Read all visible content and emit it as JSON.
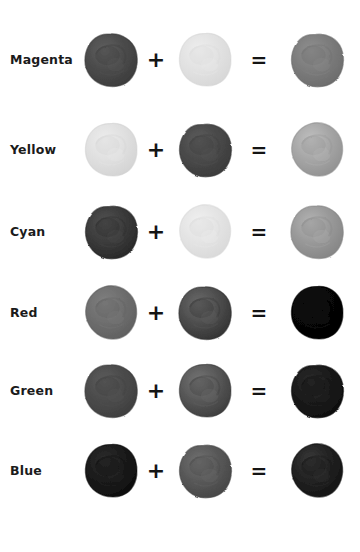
{
  "figure": {
    "background_color": "#ffffff",
    "operator_plus": "+",
    "operator_equals": "=",
    "text_color": "#1b1b1b"
  },
  "rows": [
    {
      "label": "Magenta",
      "left_swatch": {
        "name": "magenta-paint-blob",
        "gray_hex": "#4b4b4b",
        "shade_hex": "#3a3a3a",
        "highlight_hex": "#606060"
      },
      "right_swatch": {
        "name": "yellow-paint-blob",
        "gray_hex": "#e2e2e2",
        "shade_hex": "#d6d6d6",
        "highlight_hex": "#eeeeee"
      },
      "result_swatch": {
        "name": "red-result-blob",
        "gray_hex": "#7c7c7c",
        "shade_hex": "#6a6a6a",
        "highlight_hex": "#909090"
      }
    },
    {
      "label": "Yellow",
      "left_swatch": {
        "name": "yellow-paint-blob",
        "gray_hex": "#e0e0e0",
        "shade_hex": "#d2d2d2",
        "highlight_hex": "#ededed"
      },
      "right_swatch": {
        "name": "cyan-paint-blob",
        "gray_hex": "#494949",
        "shade_hex": "#393939",
        "highlight_hex": "#5d5d5d"
      },
      "result_swatch": {
        "name": "green-result-blob",
        "gray_hex": "#a6a6a6",
        "shade_hex": "#8f8f8f",
        "highlight_hex": "#c0c0c0"
      }
    },
    {
      "label": "Cyan",
      "left_swatch": {
        "name": "cyan-paint-blob",
        "gray_hex": "#3b3b3b",
        "shade_hex": "#262626",
        "highlight_hex": "#525252"
      },
      "right_swatch": {
        "name": "yellow-paint-blob",
        "gray_hex": "#e4e4e4",
        "shade_hex": "#d8d8d8",
        "highlight_hex": "#f0f0f0"
      },
      "result_swatch": {
        "name": "green-result-blob",
        "gray_hex": "#999999",
        "shade_hex": "#838383",
        "highlight_hex": "#b4b4b4"
      }
    },
    {
      "label": "Red",
      "left_swatch": {
        "name": "red-paint-blob",
        "gray_hex": "#6e6e6e",
        "shade_hex": "#5e5e5e",
        "highlight_hex": "#808080"
      },
      "right_swatch": {
        "name": "cyan-paint-blob",
        "gray_hex": "#4e4e4e",
        "shade_hex": "#303030",
        "highlight_hex": "#6a6a6a"
      },
      "result_swatch": {
        "name": "black-result-blob",
        "gray_hex": "#070707",
        "shade_hex": "#030303",
        "highlight_hex": "#121212"
      }
    },
    {
      "label": "Green",
      "left_swatch": {
        "name": "green-paint-blob",
        "gray_hex": "#4b4b4b",
        "shade_hex": "#3d3d3d",
        "highlight_hex": "#5c5c5c"
      },
      "right_swatch": {
        "name": "magenta-paint-blob",
        "gray_hex": "#585858",
        "shade_hex": "#3a3a3a",
        "highlight_hex": "#757575"
      },
      "result_swatch": {
        "name": "black-result-blob",
        "gray_hex": "#1a1a1a",
        "shade_hex": "#0d0d0d",
        "highlight_hex": "#2c2c2c"
      }
    },
    {
      "label": "Blue",
      "left_swatch": {
        "name": "blue-paint-blob",
        "gray_hex": "#1b1b1b",
        "shade_hex": "#0c0c0c",
        "highlight_hex": "#2e2e2e"
      },
      "right_swatch": {
        "name": "yellow-paint-blob",
        "gray_hex": "#585858",
        "shade_hex": "#444444",
        "highlight_hex": "#727272"
      },
      "result_swatch": {
        "name": "black-result-blob",
        "gray_hex": "#222222",
        "shade_hex": "#111111",
        "highlight_hex": "#3a3a3a"
      }
    }
  ],
  "row_tops": [
    20,
    110,
    192,
    273,
    351,
    431
  ]
}
